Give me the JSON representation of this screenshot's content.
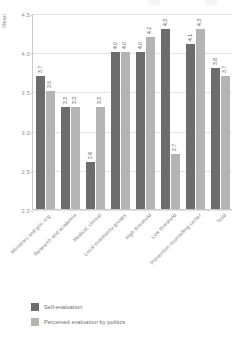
{
  "chart_data": {
    "type": "bar",
    "title": "",
    "xlabel": "",
    "ylabel": "Mean",
    "ylim": [
      2.0,
      4.5
    ],
    "yticks": [
      "2.0",
      "2.5",
      "3.0",
      "3.5",
      "4.0",
      "4.5"
    ],
    "grid": true,
    "legend_position": "bottom-left",
    "categories": [
      "Ministries and gov. org.",
      "Research and academia",
      "Medical, clinical",
      "Local community groups",
      "High threshold",
      "Low threshold",
      "Prevention counselling center",
      "Total"
    ],
    "series": [
      {
        "name": "Self-evaluation",
        "color": "#6d6d6d",
        "values": [
          3.7,
          3.3,
          2.6,
          4.0,
          4.0,
          4.3,
          4.1,
          3.8
        ],
        "labels": [
          "3.7",
          "3.3",
          "2.6",
          "4.0",
          "4.0",
          "4.3",
          "4.1",
          "3.8"
        ]
      },
      {
        "name": "Perceived evaluation by politics",
        "color": "#b4b4b4",
        "values": [
          3.5,
          3.3,
          3.3,
          4.0,
          4.2,
          2.7,
          4.3,
          3.7
        ],
        "labels": [
          "3.5",
          "3.3",
          "3.3",
          "4.0",
          "4.2",
          "2.7",
          "4.3",
          "3.7"
        ]
      }
    ]
  },
  "legend": {
    "items": [
      {
        "label": "Self-evaluation"
      },
      {
        "label": "Perceived evaluation by politics"
      }
    ]
  }
}
